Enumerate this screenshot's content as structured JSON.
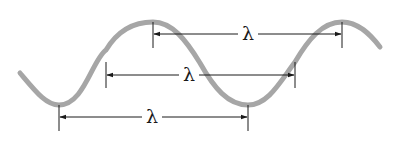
{
  "diagram": {
    "wave_color": "#a6a6a6",
    "line_color": "#1a1a1a",
    "wave": {
      "start": [
        20,
        73
      ],
      "troughs": [
        [
          59,
          105
        ],
        [
          248,
          105
        ]
      ],
      "peaks": [
        [
          153,
          22
        ],
        [
          342,
          22
        ]
      ],
      "end": [
        380,
        47
      ]
    },
    "measurements": [
      {
        "label": "λ",
        "from_x": 153,
        "to_x": 342,
        "y": 34,
        "description": "peak to peak"
      },
      {
        "label": "λ",
        "from_x": 106,
        "to_x": 295,
        "y": 75,
        "description": "midpoint to midpoint"
      },
      {
        "label": "λ",
        "from_x": 59,
        "to_x": 248,
        "y": 117,
        "description": "trough to trough"
      }
    ]
  }
}
